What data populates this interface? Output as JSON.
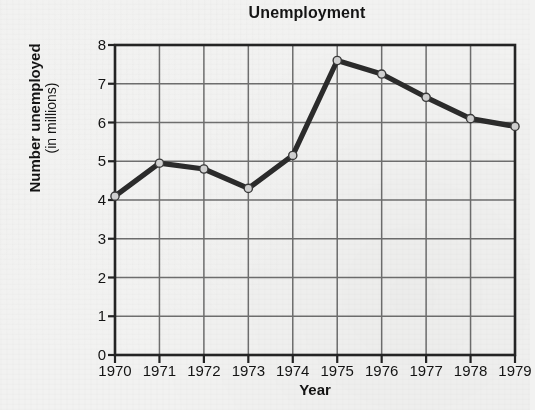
{
  "chart_data": {
    "type": "line",
    "title": "Unemployment",
    "xlabel": "Year",
    "ylabel": "Number unemployed",
    "ylabel_sub": "(in millions)",
    "categories": [
      "1970",
      "1971",
      "1972",
      "1973",
      "1974",
      "1975",
      "1976",
      "1977",
      "1978",
      "1979"
    ],
    "values": [
      4.1,
      4.95,
      4.8,
      4.3,
      5.15,
      7.6,
      7.25,
      6.65,
      6.1,
      5.9
    ],
    "series": [
      {
        "name": "Number unemployed (in millions)",
        "values": [
          4.1,
          4.95,
          4.8,
          4.3,
          5.15,
          7.6,
          7.25,
          6.65,
          6.1,
          5.9
        ]
      }
    ],
    "y_ticks": [
      "0",
      "1",
      "2",
      "3",
      "4",
      "5",
      "6",
      "7",
      "8"
    ],
    "ylim": [
      0,
      8
    ],
    "xlim": [
      "1970",
      "1979"
    ],
    "grid": "both",
    "legend": "none",
    "line_color": "#2b2b2b",
    "marker_fill": "#d2d2d2",
    "marker_edge": "#3a3a3a",
    "grid_color": "#6e6e6e",
    "axis_color": "#242424",
    "background_color": "#f2f2f1"
  },
  "figure": {
    "plot_area": {
      "left": 115,
      "top": 45,
      "right": 515,
      "bottom": 355
    }
  }
}
